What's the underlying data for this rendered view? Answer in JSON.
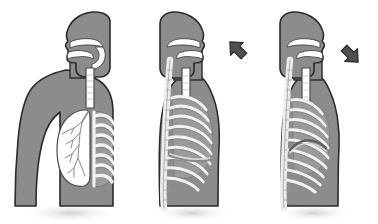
{
  "figure": {
    "title": "Respiratory system: breathing mechanics",
    "background_color": "#ffffff",
    "panel_count": 3
  },
  "palette": {
    "body_fill": "#8c8c8c",
    "body_outline": "#2b2b2b",
    "airway_white": "#ffffff",
    "airway_outline": "#4a4a4a",
    "lung_shadow": "#b9b9b9",
    "rib_light": "#f2f2f2",
    "rib_mid": "#d6d6d6",
    "rib_dark": "#6e6e6e",
    "spine_light": "#ededed",
    "arrow_fill": "#4f4f4f",
    "arrow_outline": "#2b2b2b",
    "cavity_gray": "#9a9a9a",
    "drop_shadow": "#cfcfcf"
  },
  "panels": [
    {
      "id": "panel-1",
      "name": "anatomy-overview",
      "caption": "",
      "view": "anterior",
      "orientation": "facing left",
      "arrow": null,
      "parts": [
        {
          "name": "head-profile",
          "fill": "#8c8c8c"
        },
        {
          "name": "nasal-cavity",
          "fill": "#ffffff"
        },
        {
          "name": "oral-cavity",
          "fill": "#ffffff"
        },
        {
          "name": "pharynx",
          "fill": "#ffffff"
        },
        {
          "name": "larynx",
          "fill": "#ffffff"
        },
        {
          "name": "trachea",
          "fill": "#ffffff"
        },
        {
          "name": "left-lung-bronchial-tree",
          "fill": "#ffffff"
        },
        {
          "name": "right-lung-with-ribs",
          "fill": "#9a9a9a"
        },
        {
          "name": "rib-cage",
          "fill": "#e8e8e8"
        },
        {
          "name": "torso-shoulders-arms",
          "fill": "#8c8c8c"
        }
      ]
    },
    {
      "id": "panel-2",
      "name": "inhalation",
      "caption": "",
      "view": "lateral",
      "orientation": "facing right",
      "arrow": {
        "name": "inhalation-arrow",
        "direction": "up-left",
        "meaning": "air in",
        "fill": "#4f4f4f"
      },
      "parts": [
        {
          "name": "head-profile",
          "fill": "#8c8c8c"
        },
        {
          "name": "nasal-cavity",
          "fill": "#ffffff"
        },
        {
          "name": "oral-cavity",
          "fill": "#ffffff"
        },
        {
          "name": "trachea",
          "fill": "#ffffff"
        },
        {
          "name": "vertebral-column",
          "fill": "#ededed"
        },
        {
          "name": "rib-cage-expanded",
          "fill": "#f2f2f2"
        },
        {
          "name": "diaphragm-flattened",
          "fill": "#b9b9b9"
        },
        {
          "name": "lung-cavity-expanded",
          "fill": "#9a9a9a"
        }
      ]
    },
    {
      "id": "panel-3",
      "name": "exhalation",
      "caption": "",
      "view": "lateral",
      "orientation": "facing right",
      "arrow": {
        "name": "exhalation-arrow",
        "direction": "down-right",
        "meaning": "air out",
        "fill": "#4f4f4f"
      },
      "parts": [
        {
          "name": "head-profile",
          "fill": "#8c8c8c"
        },
        {
          "name": "nasal-cavity",
          "fill": "#ffffff"
        },
        {
          "name": "oral-cavity",
          "fill": "#ffffff"
        },
        {
          "name": "trachea",
          "fill": "#ffffff"
        },
        {
          "name": "vertebral-column",
          "fill": "#ededed"
        },
        {
          "name": "rib-cage-contracted",
          "fill": "#f2f2f2"
        },
        {
          "name": "diaphragm-domed",
          "fill": "#b9b9b9"
        },
        {
          "name": "lung-cavity-contracted",
          "fill": "#9a9a9a"
        }
      ]
    }
  ]
}
